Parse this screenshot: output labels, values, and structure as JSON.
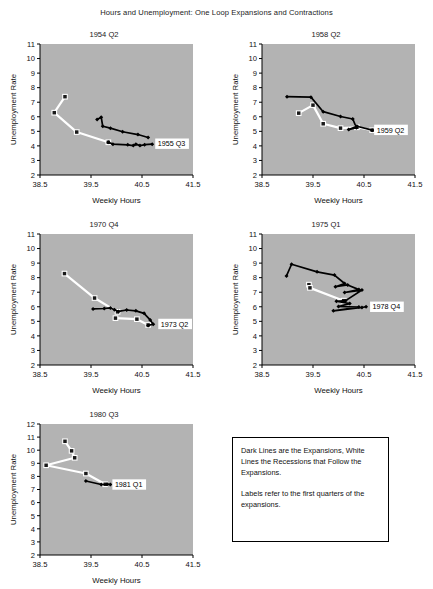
{
  "figure": {
    "title": "Hours and Unemployment: One Loop Expansions and Contractions",
    "width": 433,
    "height": 581
  },
  "legend": {
    "name": "legend-note-box",
    "paragraph1": "Dark Lines are the Expansions, White Lines the Recessions that Follow the Expansions.",
    "paragraph2": "Labels refer to the first quarters of the expansions.",
    "dark_color": "#000000",
    "white_color": "#ffffff"
  },
  "chart_data": [
    {
      "id": "panel-1954-q2",
      "type": "line",
      "title": "1954 Q2",
      "xlabel": "Weekly Hours",
      "ylabel": "Unemployment Rate",
      "xlim": [
        38.5,
        41.5
      ],
      "ylim": [
        2,
        11
      ],
      "xticks": [
        "38.5",
        "39.5",
        "40.5",
        "41.5"
      ],
      "yticks": [
        "2",
        "3",
        "4",
        "5",
        "6",
        "7",
        "8",
        "9",
        "10",
        "11"
      ],
      "grid": false,
      "plot_bg": "#b3b3b3",
      "annotation": "1955 Q3",
      "annotation_xy": [
        40.72,
        4.15
      ],
      "series": [
        {
          "name": "Expansion (dark line)",
          "style": "dark",
          "points": [
            [
              39.62,
              5.82
            ],
            [
              39.7,
              5.97
            ],
            [
              39.73,
              5.35
            ],
            [
              39.88,
              5.22
            ],
            [
              40.12,
              4.97
            ],
            [
              40.42,
              4.78
            ],
            [
              40.62,
              4.58
            ]
          ]
        },
        {
          "name": "Expansion lower branch (dark line)",
          "style": "dark",
          "points": [
            [
              39.84,
              4.25
            ],
            [
              39.93,
              4.12
            ],
            [
              40.22,
              4.07
            ],
            [
              40.33,
              4.02
            ],
            [
              40.38,
              4.12
            ],
            [
              40.46,
              4.02
            ],
            [
              40.55,
              4.08
            ],
            [
              40.7,
              4.12
            ]
          ]
        },
        {
          "name": "Recession (white line)",
          "style": "white",
          "points": [
            [
              38.99,
              7.38
            ],
            [
              38.78,
              6.28
            ],
            [
              39.22,
              4.95
            ],
            [
              39.84,
              4.25
            ]
          ]
        }
      ]
    },
    {
      "id": "panel-1958-q2",
      "type": "line",
      "title": "1958 Q2",
      "xlabel": "Weekly Hours",
      "ylabel": "Unemployment Rate",
      "xlim": [
        38.5,
        41.5
      ],
      "ylim": [
        2,
        11
      ],
      "xticks": [
        "38.5",
        "39.5",
        "40.5",
        "41.5"
      ],
      "yticks": [
        "2",
        "3",
        "4",
        "5",
        "6",
        "7",
        "8",
        "9",
        "10",
        "11"
      ],
      "grid": false,
      "plot_bg": "#b3b3b3",
      "annotation": "1959 Q2",
      "annotation_xy": [
        40.66,
        5.1
      ],
      "series": [
        {
          "name": "Expansion (dark line)",
          "style": "dark",
          "points": [
            [
              38.99,
              7.38
            ],
            [
              39.46,
              7.35
            ],
            [
              39.7,
              6.35
            ],
            [
              40.04,
              6.02
            ],
            [
              40.28,
              5.85
            ],
            [
              40.35,
              5.25
            ],
            [
              40.2,
              5.12
            ],
            [
              40.36,
              5.35
            ],
            [
              40.66,
              5.08
            ]
          ]
        },
        {
          "name": "Recession (white line)",
          "style": "white",
          "points": [
            [
              39.22,
              6.25
            ],
            [
              39.5,
              6.8
            ],
            [
              39.7,
              5.52
            ],
            [
              40.04,
              5.22
            ],
            [
              40.36,
              5.28
            ],
            [
              40.66,
              5.08
            ]
          ]
        }
      ]
    },
    {
      "id": "panel-1970-q4",
      "type": "line",
      "title": "1970 Q4",
      "xlabel": "Weekly Hours",
      "ylabel": "Unemployment Rate",
      "xlim": [
        38.5,
        41.5
      ],
      "ylim": [
        2,
        11
      ],
      "xticks": [
        "38.5",
        "39.5",
        "40.5",
        "41.5"
      ],
      "yticks": [
        "2",
        "3",
        "4",
        "5",
        "6",
        "7",
        "8",
        "9",
        "10",
        "11"
      ],
      "grid": false,
      "plot_bg": "#b3b3b3",
      "annotation": "1973 Q2",
      "annotation_xy": [
        40.78,
        4.82
      ],
      "series": [
        {
          "name": "Expansion (dark line)",
          "style": "dark",
          "points": [
            [
              39.54,
              5.85
            ],
            [
              39.76,
              5.88
            ],
            [
              39.88,
              5.92
            ],
            [
              39.96,
              5.8
            ],
            [
              40.04,
              5.68
            ],
            [
              40.2,
              5.78
            ],
            [
              40.38,
              5.72
            ],
            [
              40.54,
              5.55
            ],
            [
              40.66,
              5.1
            ],
            [
              40.72,
              4.8
            ],
            [
              40.62,
              4.72
            ]
          ]
        },
        {
          "name": "Recession (white line)",
          "style": "white",
          "points": [
            [
              38.98,
              8.28
            ],
            [
              39.57,
              6.6
            ],
            [
              40.02,
              5.65
            ]
          ]
        },
        {
          "name": "Recession lower branch (white line)",
          "style": "white",
          "points": [
            [
              39.98,
              5.22
            ],
            [
              40.4,
              5.15
            ],
            [
              40.62,
              4.75
            ]
          ]
        }
      ]
    },
    {
      "id": "panel-1975-q1",
      "type": "line",
      "title": "1975 Q1",
      "xlabel": "Weekly Hours",
      "ylabel": "Unemployment Rate",
      "xlim": [
        38.5,
        41.5
      ],
      "ylim": [
        2,
        11
      ],
      "xticks": [
        "38.5",
        "39.5",
        "40.5",
        "41.5"
      ],
      "yticks": [
        "2",
        "3",
        "4",
        "5",
        "6",
        "7",
        "8",
        "9",
        "10",
        "11"
      ],
      "grid": false,
      "plot_bg": "#b3b3b3",
      "annotation": "1978 Q4",
      "annotation_xy": [
        40.58,
        6.0
      ],
      "series": [
        {
          "name": "Expansion (dark line)",
          "style": "dark",
          "points": [
            [
              38.98,
              8.12
            ],
            [
              39.08,
              8.92
            ],
            [
              39.58,
              8.4
            ],
            [
              39.92,
              8.18
            ],
            [
              40.12,
              7.6
            ],
            [
              39.94,
              7.38
            ],
            [
              40.18,
              7.5
            ],
            [
              40.4,
              7.18
            ],
            [
              40.12,
              6.98
            ],
            [
              40.46,
              7.15
            ],
            [
              40.14,
              6.42
            ],
            [
              39.96,
              6.38
            ],
            [
              40.22,
              6.22
            ],
            [
              40.0,
              6.02
            ],
            [
              40.4,
              5.98
            ],
            [
              39.9,
              5.72
            ],
            [
              40.46,
              5.95
            ],
            [
              40.54,
              6.0
            ]
          ]
        },
        {
          "name": "Recession (white line)",
          "style": "white",
          "points": [
            [
              39.42,
              7.52
            ],
            [
              39.44,
              7.3
            ],
            [
              40.1,
              6.42
            ]
          ]
        }
      ]
    },
    {
      "id": "panel-1980-q3",
      "type": "line",
      "title": "1980 Q3",
      "xlabel": "Weekly Hours",
      "ylabel": "Unemployment Rate",
      "xlim": [
        38.5,
        41.5
      ],
      "ylim": [
        2,
        12
      ],
      "xticks": [
        "38.5",
        "39.5",
        "40.5",
        "41.5"
      ],
      "yticks": [
        "2",
        "3",
        "4",
        "5",
        "6",
        "7",
        "8",
        "9",
        "10",
        "11",
        "12"
      ],
      "grid": false,
      "plot_bg": "#b3b3b3",
      "annotation": "1981 Q1",
      "annotation_xy": [
        39.88,
        7.38
      ],
      "series": [
        {
          "name": "Expansion (dark line)",
          "style": "dark",
          "points": [
            [
              39.4,
              7.65
            ],
            [
              39.7,
              7.38
            ],
            [
              39.82,
              7.4
            ],
            [
              39.88,
              7.38
            ]
          ]
        },
        {
          "name": "Recession (white line)",
          "style": "white",
          "points": [
            [
              38.99,
              10.68
            ],
            [
              39.12,
              9.95
            ],
            [
              39.18,
              9.42
            ],
            [
              38.62,
              8.85
            ],
            [
              39.4,
              8.22
            ],
            [
              39.78,
              7.4
            ]
          ]
        }
      ]
    }
  ],
  "panel_layout": [
    {
      "left": 6,
      "top": 30,
      "width": 196,
      "height": 185
    },
    {
      "left": 228,
      "top": 30,
      "width": 196,
      "height": 185
    },
    {
      "left": 6,
      "top": 220,
      "width": 196,
      "height": 185
    },
    {
      "left": 228,
      "top": 220,
      "width": 196,
      "height": 185
    },
    {
      "left": 6,
      "top": 410,
      "width": 196,
      "height": 185
    }
  ],
  "legend_layout": {
    "left": 232,
    "top": 437,
    "width": 157,
    "height": 105
  }
}
